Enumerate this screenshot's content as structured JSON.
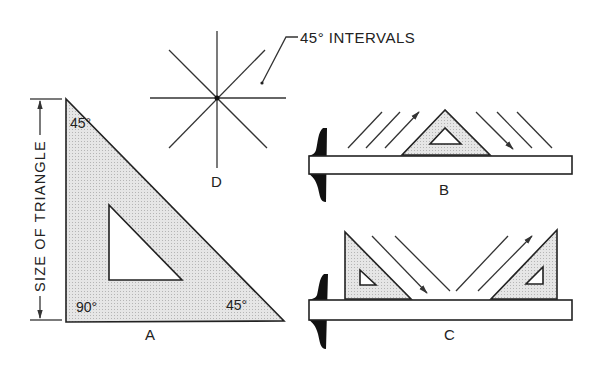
{
  "figure": {
    "annotations": {
      "star_callout": "45° INTERVALS",
      "dimension_label": "SIZE OF TRIANGLE"
    },
    "panels": [
      {
        "id": "A",
        "label": "A",
        "description": "45° triangle with angle labels",
        "angles": {
          "top": "45°",
          "bottom_left": "90°",
          "bottom_right": "45°"
        }
      },
      {
        "id": "B",
        "label": "B",
        "description": "45° triangle resting on T-square blade, drawing lines at 45° intervals"
      },
      {
        "id": "C",
        "label": "C",
        "description": "Two 45° triangles on T-square blade, drawing converging lines"
      },
      {
        "id": "D",
        "label": "D",
        "description": "Star of lines at 45° intervals"
      }
    ],
    "colors": {
      "stroke": "#222222",
      "triangle_fill": "#dcdcdc",
      "tsquare_head": "#111111",
      "background": "#ffffff"
    }
  }
}
